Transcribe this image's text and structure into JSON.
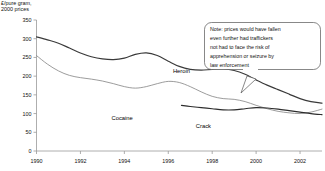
{
  "chart_data": {
    "type": "line",
    "title": "",
    "ylabel": "£/pure gram,\n2000 prices",
    "xlabel": "",
    "ylim": [
      0,
      350
    ],
    "xlim": [
      1990,
      2003
    ],
    "grid": false,
    "legend": "inline-labels",
    "yticks": [
      "0",
      "50",
      "100",
      "150",
      "200",
      "250",
      "300",
      "350"
    ],
    "ytick_values": [
      0,
      50,
      100,
      150,
      200,
      250,
      300,
      350
    ],
    "xticks": [
      "1990",
      "1992",
      "1994",
      "1996",
      "1998",
      "2000",
      "2002"
    ],
    "xtick_values": [
      1990,
      1992,
      1994,
      1996,
      1998,
      2000,
      2002
    ],
    "series": [
      {
        "name": "Heroin",
        "color": "#3a3a3a",
        "label_x": 1996.6,
        "label_y": 208,
        "x": [
          1990,
          1990.5,
          1991,
          1991.5,
          1992,
          1992.5,
          1993,
          1993.5,
          1994,
          1994.5,
          1995,
          1995.5,
          1996,
          1996.5,
          1997,
          1997.5,
          1998,
          1998.5,
          1999,
          1999.5,
          2000,
          2000.5,
          2001,
          2001.5,
          2002,
          2002.5,
          2003
        ],
        "values": [
          305,
          297,
          288,
          275,
          262,
          252,
          246,
          244,
          248,
          258,
          262,
          255,
          240,
          226,
          218,
          216,
          218,
          219,
          215,
          205,
          190,
          176,
          164,
          152,
          140,
          132,
          128
        ]
      },
      {
        "name": "Cocaine",
        "color": "#8a8a8a",
        "label_x": 1993.9,
        "label_y": 84,
        "x": [
          1990,
          1990.5,
          1991,
          1991.5,
          1992,
          1992.5,
          1993,
          1993.5,
          1994,
          1994.5,
          1995,
          1995.5,
          1996,
          1996.5,
          1997,
          1997.5,
          1998,
          1998.5,
          1999,
          1999.5,
          2000,
          2000.5,
          2001,
          2001.5,
          2002,
          2002.5,
          2003
        ],
        "values": [
          255,
          232,
          214,
          202,
          196,
          192,
          187,
          180,
          172,
          168,
          172,
          180,
          186,
          183,
          172,
          158,
          146,
          140,
          138,
          132,
          122,
          113,
          106,
          102,
          100,
          104,
          112
        ]
      },
      {
        "name": "Crack",
        "color": "#2d2d2d",
        "label_x": 1997.6,
        "label_y": 62,
        "x": [
          1996.6,
          1997,
          1997.5,
          1998,
          1998.5,
          1999,
          1999.5,
          2000,
          2000.5,
          2001,
          2001.5,
          2002,
          2002.5,
          2003
        ],
        "values": [
          122,
          119,
          116,
          113,
          110,
          110,
          113,
          116,
          115,
          112,
          108,
          104,
          100,
          97
        ]
      }
    ],
    "annotations": [
      {
        "name": "law-enforcement-note",
        "lines": [
          "Note: prices would have fallen",
          "even further had traffickers",
          "not had to face the risk of",
          "apprehension or seizure by",
          "law enforcement"
        ]
      }
    ]
  }
}
